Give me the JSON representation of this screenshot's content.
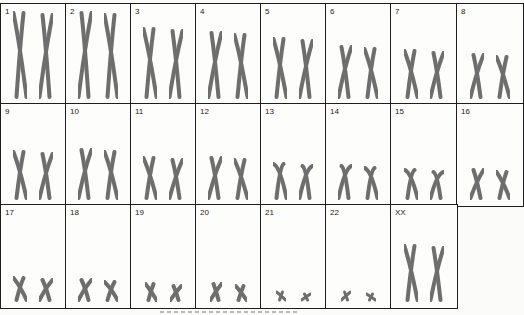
{
  "figure": {
    "type": "karyotype",
    "colors": {
      "grid_line": "#1e1e1e",
      "chromosome": "#6e6e6e",
      "background": "#fdfdfb"
    },
    "cells": [
      {
        "label": "1",
        "height": 88,
        "shape": "long"
      },
      {
        "label": "2",
        "height": 88,
        "shape": "long"
      },
      {
        "label": "3",
        "height": 72,
        "shape": "long"
      },
      {
        "label": "4",
        "height": 68,
        "shape": "long"
      },
      {
        "label": "5",
        "height": 62,
        "shape": "long"
      },
      {
        "label": "6",
        "height": 54,
        "shape": "medium"
      },
      {
        "label": "7",
        "height": 50,
        "shape": "medium"
      },
      {
        "label": "8",
        "height": 46,
        "shape": "medium"
      },
      {
        "label": "9",
        "height": 50,
        "shape": "medium"
      },
      {
        "label": "10",
        "height": 52,
        "shape": "medium"
      },
      {
        "label": "11",
        "height": 44,
        "shape": "medium"
      },
      {
        "label": "12",
        "height": 44,
        "shape": "medium"
      },
      {
        "label": "13",
        "height": 38,
        "shape": "acro"
      },
      {
        "label": "14",
        "height": 36,
        "shape": "acro"
      },
      {
        "label": "15",
        "height": 32,
        "shape": "acro"
      },
      {
        "label": "16",
        "height": 32,
        "shape": "medium"
      },
      {
        "label": "17",
        "height": 26,
        "shape": "medium"
      },
      {
        "label": "18",
        "height": 24,
        "shape": "medium"
      },
      {
        "label": "19",
        "height": 20,
        "shape": "small"
      },
      {
        "label": "20",
        "height": 20,
        "shape": "small"
      },
      {
        "label": "21",
        "height": 12,
        "shape": "tiny"
      },
      {
        "label": "22",
        "height": 12,
        "shape": "tiny"
      },
      {
        "label": "XX",
        "height": 58,
        "shape": "long"
      }
    ]
  }
}
